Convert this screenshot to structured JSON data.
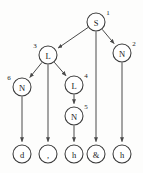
{
  "diagram": {
    "type": "parse-tree",
    "caption": "",
    "nodes": [
      {
        "id": "n1",
        "label": "S",
        "index": "1",
        "cx": 96,
        "cy": 22,
        "r": 9,
        "index_dx": 12,
        "index_dy": -9
      },
      {
        "id": "n2",
        "label": "N",
        "index": "2",
        "cx": 122,
        "cy": 53,
        "r": 9,
        "index_dx": 12,
        "index_dy": -9
      },
      {
        "id": "n3",
        "label": "L",
        "index": "3",
        "cx": 48,
        "cy": 55,
        "r": 9,
        "index_dx": -13,
        "index_dy": -9
      },
      {
        "id": "n4",
        "label": "L",
        "index": "4",
        "cx": 74,
        "cy": 85,
        "r": 9,
        "index_dx": 12,
        "index_dy": -9
      },
      {
        "id": "n5",
        "label": "N",
        "index": "5",
        "cx": 74,
        "cy": 116,
        "r": 9,
        "index_dx": 12,
        "index_dy": -9
      },
      {
        "id": "n6",
        "label": "N",
        "index": "6",
        "cx": 22,
        "cy": 87,
        "r": 9,
        "index_dx": -13,
        "index_dy": -9
      },
      {
        "id": "l1",
        "label": "d",
        "index": "",
        "cx": 22,
        "cy": 154,
        "r": 9,
        "index_dx": 0,
        "index_dy": 0
      },
      {
        "id": "l2",
        "label": ",",
        "index": "",
        "cx": 48,
        "cy": 154,
        "r": 9,
        "index_dx": 0,
        "index_dy": 0
      },
      {
        "id": "l3",
        "label": "h",
        "index": "",
        "cx": 74,
        "cy": 154,
        "r": 9,
        "index_dx": 0,
        "index_dy": 0
      },
      {
        "id": "l4",
        "label": "&",
        "index": "",
        "cx": 96,
        "cy": 154,
        "r": 9,
        "index_dx": 0,
        "index_dy": 0
      },
      {
        "id": "l5",
        "label": "h",
        "index": "",
        "cx": 122,
        "cy": 154,
        "r": 9,
        "index_dx": 0,
        "index_dy": 0
      }
    ],
    "edges": [
      {
        "from": "n1",
        "to": "n3",
        "arrow": true
      },
      {
        "from": "n1",
        "to": "n2",
        "arrow": true
      },
      {
        "from": "n1",
        "to": "l4",
        "arrow": true
      },
      {
        "from": "n3",
        "to": "n6",
        "arrow": true
      },
      {
        "from": "n3",
        "to": "n4",
        "arrow": true
      },
      {
        "from": "n3",
        "to": "l2",
        "arrow": true
      },
      {
        "from": "n4",
        "to": "n5",
        "arrow": true
      },
      {
        "from": "n5",
        "to": "l3",
        "arrow": true
      },
      {
        "from": "n6",
        "to": "l1",
        "arrow": true
      },
      {
        "from": "n2",
        "to": "l5",
        "arrow": true
      }
    ],
    "colors": {
      "node_stroke": "#3a3a3a",
      "node_fill": "#ffffff",
      "edge_stroke": "#4a4a4a",
      "text": "#1c1c1c",
      "background": "#fdfdfc"
    }
  }
}
